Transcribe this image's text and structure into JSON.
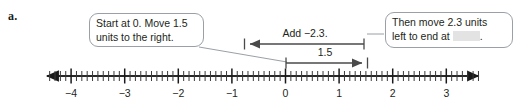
{
  "problem": {
    "letter": "a."
  },
  "callouts": {
    "start": {
      "line1": "Start at 0. Move 1.5",
      "line2": "units to the right."
    },
    "end": {
      "line1": "Then move 2.3 units",
      "line2_before": "left to end at",
      "line2_after": "."
    }
  },
  "arrows": {
    "add": {
      "label": "Add −2.3.",
      "from": 1.5,
      "to": -0.8,
      "direction": "left"
    },
    "move": {
      "label": "1.5",
      "from": 0,
      "to": 1.5,
      "direction": "right"
    }
  },
  "chart_data": {
    "type": "number-line",
    "title": "",
    "xlabel": "",
    "axis_min": -4.6,
    "axis_max": 3.75,
    "major_ticks": [
      -4,
      -3,
      -2,
      -1,
      0,
      1,
      2,
      3
    ],
    "tick_labels": [
      "−4",
      "−3",
      "−2",
      "−1",
      "0",
      "1",
      "2",
      "3"
    ],
    "minor_tick_interval": 0.1,
    "minor_ticks_per_major": 10,
    "arrowheads": [
      "left",
      "right"
    ],
    "annotations": [
      {
        "label": "1.5",
        "start": 0,
        "end": 1.5
      },
      {
        "label": "Add −2.3.",
        "start": 1.5,
        "end": -0.8
      }
    ],
    "colors": {
      "axis": "#1a1a1a",
      "vector": "#4a4a4a",
      "callout_border": "#9aa0a6",
      "blank_fill": "#e3e3e3"
    }
  }
}
